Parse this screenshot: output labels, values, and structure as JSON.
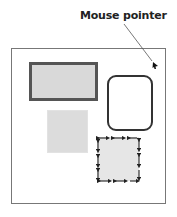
{
  "annotation": {
    "label": "Mouse pointer"
  },
  "diagram": {
    "frame": {
      "description": "window frame"
    },
    "shapes": [
      {
        "id": "thick-border-rectangle",
        "fill": "#d9d9d9",
        "border": "#555555"
      },
      {
        "id": "rounded-rectangle",
        "fill": "#ffffff",
        "border": "#333333"
      },
      {
        "id": "plain-gray-square",
        "fill": "#dcdcdc"
      },
      {
        "id": "resize-handle-square",
        "fill": "#e6e6e6",
        "border_style": "double-headed arrows"
      }
    ],
    "pointer": {
      "icon": "mouse-pointer-arrow"
    }
  }
}
